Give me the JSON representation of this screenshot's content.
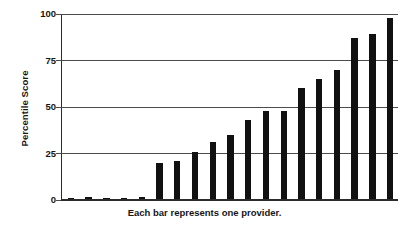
{
  "chart_data": {
    "type": "bar",
    "title": "",
    "subtitle": "",
    "xlabel": "Each bar represents one provider.",
    "ylabel": "Percentile Score",
    "ylim": [
      0,
      100
    ],
    "yticks": [
      0,
      25,
      50,
      75,
      100
    ],
    "ytick_labels": [
      "0",
      "25",
      "50",
      "75",
      "100"
    ],
    "grid": true,
    "legend": false,
    "legend_position": "none",
    "bar_color": "#111111",
    "axis_color": "#4c4c4c",
    "categories": [
      "provider-1",
      "provider-2",
      "provider-3",
      "provider-4",
      "provider-5",
      "provider-6",
      "provider-7",
      "provider-8",
      "provider-9",
      "provider-10",
      "provider-11",
      "provider-12",
      "provider-13",
      "provider-14",
      "provider-15",
      "provider-16",
      "provider-17",
      "provider-18",
      "provider-19"
    ],
    "values": [
      0.5,
      1.5,
      1.0,
      1.2,
      1.8,
      20,
      21,
      26,
      31,
      35,
      43,
      48,
      48,
      60,
      65,
      70,
      87,
      89,
      98
    ],
    "series": [
      {
        "name": "Percentile Score",
        "values": [
          0.5,
          1.5,
          1.0,
          1.2,
          1.8,
          20,
          21,
          26,
          31,
          35,
          43,
          48,
          48,
          60,
          65,
          70,
          87,
          89,
          98
        ]
      }
    ]
  },
  "caption": {
    "text": "Each bar represents one provider."
  },
  "axis": {
    "y_title": "Percentile Score"
  }
}
